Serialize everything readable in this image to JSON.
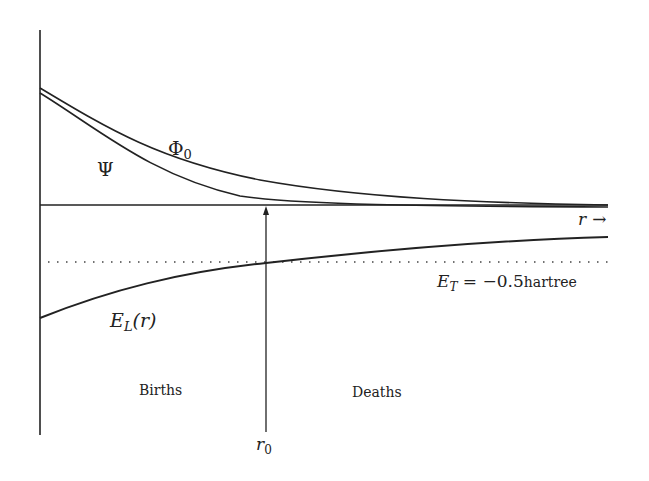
{
  "diagram": {
    "labels": {
      "phi0": "Φ",
      "phi0_sub": "0",
      "psi": "Ψ",
      "r_axis": "r",
      "r_axis_arrow": "→",
      "el_main": "E",
      "el_sub": "L",
      "el_arg": "(r)",
      "et_main": "E",
      "et_sub": "T",
      "et_value": " = −0.5",
      "et_unit": "hartree",
      "births": "Births",
      "deaths": "Deaths",
      "r0_main": "r",
      "r0_sub": "0"
    },
    "curves": [
      {
        "name": "Phi_0",
        "description": "upper decaying curve"
      },
      {
        "name": "Psi",
        "description": "lower decaying curve"
      },
      {
        "name": "E_L(r)",
        "description": "local energy rising toward zero"
      }
    ],
    "reference_line": {
      "name": "E_T",
      "value": -0.5,
      "unit": "hartree",
      "style": "dotted"
    },
    "marker": {
      "name": "r_0",
      "description": "crossing point of E_L and E_T"
    },
    "colors": {
      "ink": "#222222",
      "background": "#ffffff"
    }
  }
}
